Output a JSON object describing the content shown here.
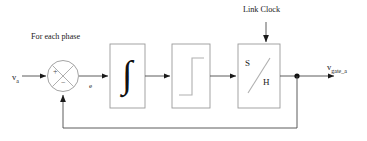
{
  "diagram": {
    "title_annotation": "For each phase",
    "clock_label": "Link Clock",
    "input_signal": {
      "base": "v",
      "sub": "a"
    },
    "output_signal": {
      "base": "v",
      "sub": "gate_a"
    },
    "error_label": "e",
    "summing_junction": {
      "name": "summing-junction",
      "positive_sign": "+",
      "negative_sign": "−"
    },
    "blocks": [
      {
        "id": "integrator",
        "label": "∫",
        "name": "integrator-block"
      },
      {
        "id": "relay",
        "label": "",
        "name": "relay-block"
      },
      {
        "id": "sample-hold",
        "label_top": "S",
        "label_bottom": "H",
        "name": "sample-hold-block"
      }
    ],
    "colors": {
      "stroke": "#9a9a9a",
      "signal": "#4a4a4a",
      "text": "#1a1a1a",
      "background": "#ffffff"
    }
  }
}
